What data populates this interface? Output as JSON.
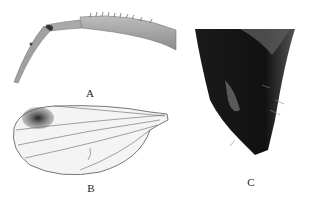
{
  "figure": {
    "panels": [
      {
        "id": "A",
        "label": "A",
        "subject": "leg"
      },
      {
        "id": "B",
        "label": "B",
        "subject": "wing"
      },
      {
        "id": "C",
        "label": "C",
        "subject": "abdomen-tip"
      }
    ]
  }
}
